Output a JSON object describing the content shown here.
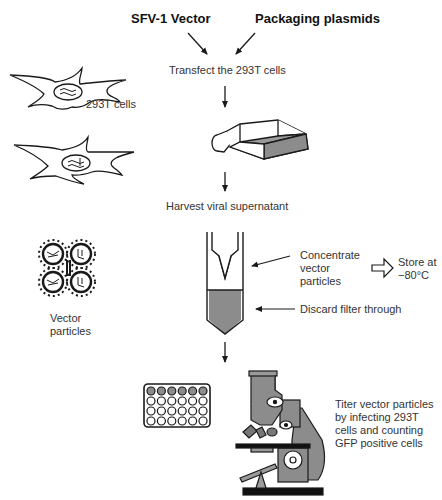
{
  "inputs": {
    "vector": "SFV-1 Vector",
    "plasmids": "Packaging plasmids"
  },
  "steps": {
    "transfect": "Transfect the 293T cells",
    "harvest": "Harvest viral supernatant",
    "concentrate": [
      "Concentrate",
      "vector",
      "particles"
    ],
    "store": [
      "Store at",
      "−80°C"
    ],
    "discard": "Discard filter through",
    "titer": [
      "Titer vector particles",
      "by infecting 293T",
      "cells and counting",
      "GFP positive cells"
    ]
  },
  "side_labels": {
    "cells": "293T cells",
    "particles": [
      "Vector",
      "particles"
    ]
  },
  "colors": {
    "line": "#1a1a1a",
    "gray_fill": "#8c8c8c",
    "light_gray": "#a8a8a8"
  },
  "plate": {
    "rows": 4,
    "cols": 6,
    "filled_rows": 1
  }
}
